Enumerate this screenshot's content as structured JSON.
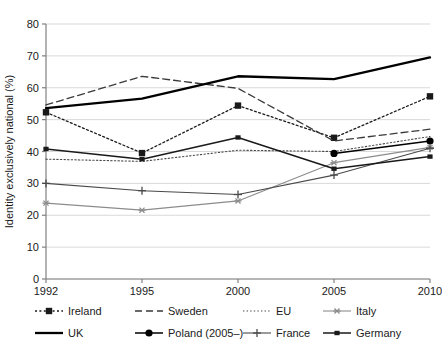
{
  "chart_data": {
    "type": "line",
    "title": "",
    "xlabel": "",
    "ylabel": "Identity exclusively national (%)",
    "categories": [
      "1992",
      "1995",
      "2000",
      "2005",
      "2010"
    ],
    "ylim": [
      0,
      80
    ],
    "yticks": [
      0,
      10,
      20,
      30,
      40,
      50,
      60,
      70,
      80
    ],
    "grid": true,
    "legend_position": "bottom",
    "series": [
      {
        "name": "Ireland",
        "style": "dotted",
        "marker": "square",
        "color": "#1a1a1a",
        "values": [
          52.3,
          39.5,
          54.4,
          44.3,
          57.3
        ]
      },
      {
        "name": "Sweden",
        "style": "dashed",
        "marker": "none",
        "color": "#3a3a3a",
        "values": [
          54.6,
          63.6,
          59.8,
          43.3,
          47.0
        ]
      },
      {
        "name": "EU",
        "style": "fine-dotted",
        "marker": "none",
        "color": "#4a4a4a",
        "values": [
          37.6,
          36.9,
          40.4,
          40.0,
          44.7
        ]
      },
      {
        "name": "Italy",
        "style": "solid-gray",
        "marker": "asterisk",
        "color": "#8c8c8c",
        "values": [
          23.8,
          21.6,
          24.5,
          36.5,
          41.3
        ]
      },
      {
        "name": "UK",
        "style": "thick-solid",
        "marker": "none",
        "color": "#000000",
        "values": [
          53.6,
          56.6,
          63.6,
          62.7,
          69.5
        ]
      },
      {
        "name": "Poland (2005–)",
        "style": "solid",
        "marker": "circle",
        "color": "#000000",
        "values": [
          null,
          null,
          null,
          39.4,
          43.3
        ]
      },
      {
        "name": "France",
        "style": "solid-thin",
        "marker": "plus",
        "color": "#4a4a4a",
        "values": [
          30.0,
          27.7,
          26.5,
          32.6,
          41.0
        ]
      },
      {
        "name": "Germany",
        "style": "solid",
        "marker": "dash-square",
        "color": "#1a1a1a",
        "values": [
          40.8,
          37.6,
          44.4,
          34.6,
          38.4
        ]
      }
    ]
  },
  "legend": {
    "rows": [
      [
        "Ireland",
        "Sweden",
        "EU",
        "Italy"
      ],
      [
        "UK",
        "Poland (2005–)",
        "France",
        "Germany"
      ]
    ]
  }
}
